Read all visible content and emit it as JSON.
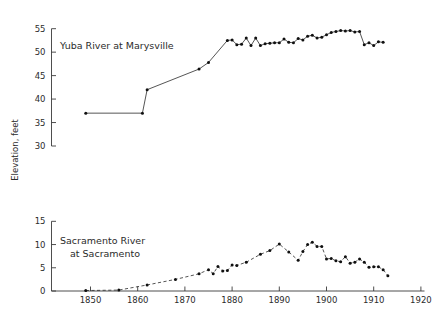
{
  "figure": {
    "ylabel": "Elevation, feet",
    "xlim": [
      1843,
      1921
    ],
    "xticks": [
      1850,
      1860,
      1870,
      1880,
      1890,
      1900,
      1910,
      1920
    ],
    "xticklabels": [
      "1850",
      "1860",
      "1870",
      "1880",
      "1890",
      "1900",
      "1910",
      "1920"
    ]
  },
  "chart_data": [
    {
      "type": "line",
      "title": "Yuba River at Marysville",
      "xlabel": "",
      "ylabel": "Elevation, feet",
      "xlim": [
        1843,
        1921
      ],
      "ylim": [
        30,
        56
      ],
      "yticks": [
        30,
        35,
        40,
        45,
        50,
        55
      ],
      "yticklabels": [
        "30",
        "35",
        "40",
        "45",
        "50",
        "55"
      ],
      "grid": false,
      "legend": "none",
      "line_style": "solid",
      "marker": "dot",
      "x": [
        1849,
        1861,
        1862,
        1873,
        1875,
        1879,
        1880,
        1881,
        1882,
        1883,
        1884,
        1885,
        1886,
        1887,
        1888,
        1889,
        1890,
        1891,
        1892,
        1893,
        1894,
        1895,
        1896,
        1897,
        1898,
        1899,
        1900,
        1901,
        1902,
        1903,
        1904,
        1905,
        1906,
        1907,
        1908,
        1909,
        1910,
        1911,
        1912
      ],
      "y": [
        37.0,
        37.0,
        42.0,
        46.4,
        47.8,
        52.5,
        52.6,
        51.6,
        51.7,
        53.0,
        51.4,
        53.0,
        51.4,
        51.8,
        51.9,
        52.0,
        52.0,
        52.8,
        52.1,
        52.0,
        52.9,
        52.6,
        53.4,
        53.6,
        53.0,
        53.2,
        53.7,
        54.2,
        54.4,
        54.6,
        54.5,
        54.6,
        54.3,
        54.4,
        51.6,
        52.0,
        51.4,
        52.2,
        52.1
      ]
    },
    {
      "type": "line",
      "title": "Sacramento River at Sacramento",
      "title_line1": "Sacramento River",
      "title_line2": "at Sacramento",
      "xlabel": "",
      "ylabel": "Elevation, feet",
      "xlim": [
        1843,
        1921
      ],
      "ylim": [
        0,
        15.5
      ],
      "yticks": [
        0,
        5,
        10,
        15
      ],
      "yticklabels": [
        "0",
        "5",
        "10",
        "15"
      ],
      "grid": false,
      "legend": "none",
      "line_style": "dashed",
      "marker": "dot",
      "x": [
        1849,
        1856,
        1862,
        1868,
        1873,
        1875,
        1876,
        1877,
        1878,
        1879,
        1880,
        1881,
        1883,
        1886,
        1888,
        1890,
        1892,
        1894,
        1895,
        1896,
        1897,
        1898,
        1899,
        1900,
        1901,
        1902,
        1903,
        1904,
        1905,
        1906,
        1907,
        1908,
        1909,
        1910,
        1911,
        1912,
        1913
      ],
      "y": [
        0.1,
        0.2,
        1.3,
        2.5,
        3.7,
        4.6,
        3.7,
        5.3,
        4.3,
        4.4,
        5.6,
        5.5,
        6.2,
        7.9,
        8.7,
        10.1,
        8.4,
        6.6,
        8.5,
        10.0,
        10.5,
        9.6,
        9.6,
        6.9,
        7.0,
        6.5,
        6.3,
        7.4,
        6.0,
        6.2,
        6.9,
        6.2,
        5.1,
        5.2,
        5.2,
        4.6,
        3.3
      ]
    }
  ]
}
